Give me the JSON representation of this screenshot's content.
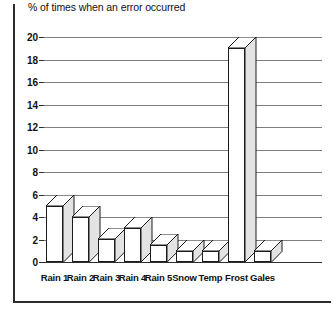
{
  "chart_data": {
    "type": "bar",
    "title": "% of times when an error occurred",
    "xlabel": "",
    "ylabel": "",
    "ylim": [
      0,
      20
    ],
    "ytick_step": 2,
    "yticks": [
      20,
      18,
      16,
      14,
      12,
      10,
      8,
      6,
      4,
      2,
      0
    ],
    "grid": true,
    "legend": "none",
    "style": "3d-column",
    "categories": [
      "Rain 1",
      "Rain 2",
      "Rain 3",
      "Rain 4",
      "Rain 5",
      "Snow",
      "Temp",
      "Frost",
      "Gales"
    ],
    "values": [
      6,
      5,
      3,
      4,
      2.5,
      2,
      2,
      20,
      2
    ],
    "series": [
      {
        "name": "% of times when an error occurred",
        "values": [
          6,
          5,
          3,
          4,
          2.5,
          2,
          2,
          20,
          2
        ]
      }
    ]
  },
  "colors": {
    "bar_front": "#ffffff",
    "bar_side": "#e3e3e3",
    "bar_outline": "#1c1c1c",
    "gridline": "#7d7d7d",
    "axis": "#2f2f2f",
    "frame": "#2b2b2b",
    "text": "#111111",
    "background": "#ffffff"
  }
}
